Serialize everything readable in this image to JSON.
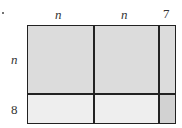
{
  "diagram": {
    "type": "area-model",
    "top_labels": [
      "n",
      "n",
      "7"
    ],
    "side_labels": [
      "n",
      "8"
    ],
    "colors": {
      "dark_fill": "#dcdcdc",
      "light_fill": "#eeeeee",
      "corner_fill": "#d2d2d2",
      "border": "#222222"
    }
  }
}
